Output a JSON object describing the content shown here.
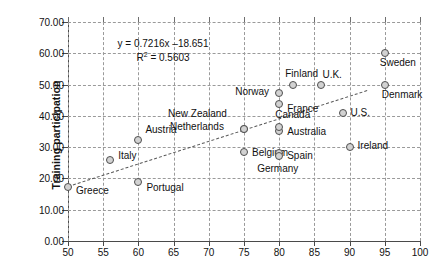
{
  "chart_data": {
    "type": "scatter",
    "title": "",
    "xlabel": "",
    "ylabel": "Training participation",
    "xlim": [
      50,
      100
    ],
    "ylim": [
      0,
      70
    ],
    "xticks": [
      50,
      55,
      60,
      65,
      70,
      75,
      80,
      85,
      90,
      95,
      100
    ],
    "yticks": [
      "0.00",
      "10.00",
      "20.00",
      "30.00",
      "40.00",
      "50.00",
      "60.00",
      "70.00"
    ],
    "ytick_values": [
      0,
      10,
      20,
      30,
      40,
      50,
      60,
      70
    ],
    "grid": true,
    "legend": "none",
    "annotations": {
      "equation": "y = 0.7216x –18.651",
      "r_squared_prefix": "R",
      "r_squared_sup": "2",
      "r_squared_value": "= 0.5603"
    },
    "trendline": {
      "type": "linear",
      "slope": 0.7216,
      "intercept": -18.651,
      "x_start": 50,
      "x_end": 92.5
    },
    "points": [
      {
        "label": "Greece",
        "x": 50.0,
        "y": 17.2,
        "lx": 8,
        "ly": 4
      },
      {
        "label": "Italy",
        "x": 56.0,
        "y": 25.8,
        "lx": 8,
        "ly": -4
      },
      {
        "label": "Austria",
        "x": 60.0,
        "y": 32.2,
        "lx": 7,
        "ly": -10
      },
      {
        "label": "Portugal",
        "x": 60.0,
        "y": 19.0,
        "lx": 8,
        "ly": 6
      },
      {
        "label": "Netherlands",
        "x": 75.0,
        "y": 35.7,
        "lx": -74,
        "ly": -2
      },
      {
        "label": "New Zealand",
        "x": 75.0,
        "y": 35.7,
        "lx": -76,
        "ly": -15
      },
      {
        "label": "Belgium",
        "x": 75.0,
        "y": 28.3,
        "lx": 8,
        "ly": 1
      },
      {
        "label": "Australia",
        "x": 80.0,
        "y": 35.3,
        "lx": 8,
        "ly": 1
      },
      {
        "label": "Canada",
        "x": 80.0,
        "y": 36.3,
        "lx": -4,
        "ly": -12
      },
      {
        "label": "Spain",
        "x": 80.0,
        "y": 28.0,
        "lx": 8,
        "ly": 3
      },
      {
        "label": "Germany",
        "x": 80.0,
        "y": 27.2,
        "lx": -22,
        "ly": 13
      },
      {
        "label": "Norway",
        "x": 80.0,
        "y": 47.2,
        "lx": -44,
        "ly": -1
      },
      {
        "label": "France",
        "x": 80.0,
        "y": 43.8,
        "lx": 8,
        "ly": 5
      },
      {
        "label": "Finland",
        "x": 82.0,
        "y": 49.8,
        "lx": -8,
        "ly": -11
      },
      {
        "label": "U.K.",
        "x": 86.0,
        "y": 49.8,
        "lx": 1,
        "ly": -10
      },
      {
        "label": "U.S.",
        "x": 89.0,
        "y": 41.0,
        "lx": 8,
        "ly": 0
      },
      {
        "label": "Ireland",
        "x": 90.0,
        "y": 30.2,
        "lx": 8,
        "ly": -1
      },
      {
        "label": "Sweden",
        "x": 95.0,
        "y": 60.0,
        "lx": -5,
        "ly": 10
      },
      {
        "label": "Denmark",
        "x": 95.0,
        "y": 50.0,
        "lx": -3,
        "ly": 10
      }
    ]
  }
}
